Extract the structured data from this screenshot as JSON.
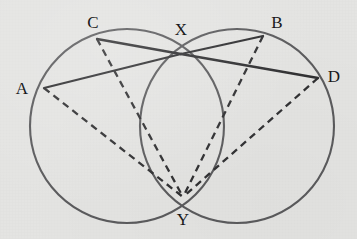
{
  "figure": {
    "width": 357,
    "height": 239,
    "background_color": "#e4e4e2",
    "stroke_color": "#3a3a3c",
    "circle_color": "#5a5a5c",
    "label_color": "#19191b",
    "caption": ""
  },
  "labels": {
    "a": "A",
    "b": "B",
    "c": "C",
    "d": "D",
    "x": "X",
    "y": "Y"
  },
  "chart_data": {
    "type": "diagram",
    "title": "",
    "subtitle": "",
    "circles": [
      {
        "name": "left-circle",
        "cx": 127,
        "cy": 126,
        "r": 97,
        "stroke": "#5a5a5c",
        "stroke_width": 2.1
      },
      {
        "name": "right-circle",
        "cx": 237,
        "cy": 126,
        "r": 97,
        "stroke": "#5a5a5c",
        "stroke_width": 2.1
      }
    ],
    "points": [
      {
        "id": "A",
        "x": 44,
        "y": 88,
        "label_x": 22,
        "label_y": 88,
        "on": "left-circle"
      },
      {
        "id": "C",
        "x": 97,
        "y": 39,
        "label_x": 93,
        "label_y": 22,
        "on": "left-circle"
      },
      {
        "id": "X",
        "x": 181,
        "y": 54,
        "label_x": 181,
        "label_y": 29,
        "on": "intersection"
      },
      {
        "id": "B",
        "x": 263,
        "y": 36,
        "label_x": 277,
        "label_y": 22,
        "on": "right-circle"
      },
      {
        "id": "D",
        "x": 318,
        "y": 78,
        "label_x": 334,
        "label_y": 76,
        "on": "right-circle"
      },
      {
        "id": "Y",
        "x": 183,
        "y": 197,
        "label_x": 183,
        "label_y": 219,
        "on": "intersection"
      }
    ],
    "solid_segments": [
      {
        "name": "segment-A-X",
        "from": "A",
        "to": "X",
        "x1": 44,
        "y1": 88,
        "x2": 181,
        "y2": 54
      },
      {
        "name": "segment-X-B",
        "from": "X",
        "to": "B",
        "x1": 181,
        "y1": 54,
        "x2": 263,
        "y2": 36
      },
      {
        "name": "segment-C-X",
        "from": "C",
        "to": "X",
        "x1": 97,
        "y1": 39,
        "x2": 181,
        "y2": 54
      },
      {
        "name": "segment-X-D",
        "from": "X",
        "to": "D",
        "x1": 181,
        "y1": 54,
        "x2": 318,
        "y2": 78
      }
    ],
    "dashed_segments": [
      {
        "name": "segment-A-Y",
        "from": "A",
        "to": "Y",
        "x1": 44,
        "y1": 88,
        "x2": 183,
        "y2": 197
      },
      {
        "name": "segment-C-Y",
        "from": "C",
        "to": "Y",
        "x1": 97,
        "y1": 39,
        "x2": 183,
        "y2": 197
      },
      {
        "name": "segment-B-Y",
        "from": "B",
        "to": "Y",
        "x1": 263,
        "y1": 36,
        "x2": 183,
        "y2": 197
      },
      {
        "name": "segment-D-Y",
        "from": "D",
        "to": "Y",
        "x1": 318,
        "y1": 78,
        "x2": 183,
        "y2": 197
      }
    ],
    "dash_pattern": "7 5",
    "line_width_solid": 2.3,
    "line_width_dashed": 2.3,
    "legend": [],
    "annotations": []
  }
}
